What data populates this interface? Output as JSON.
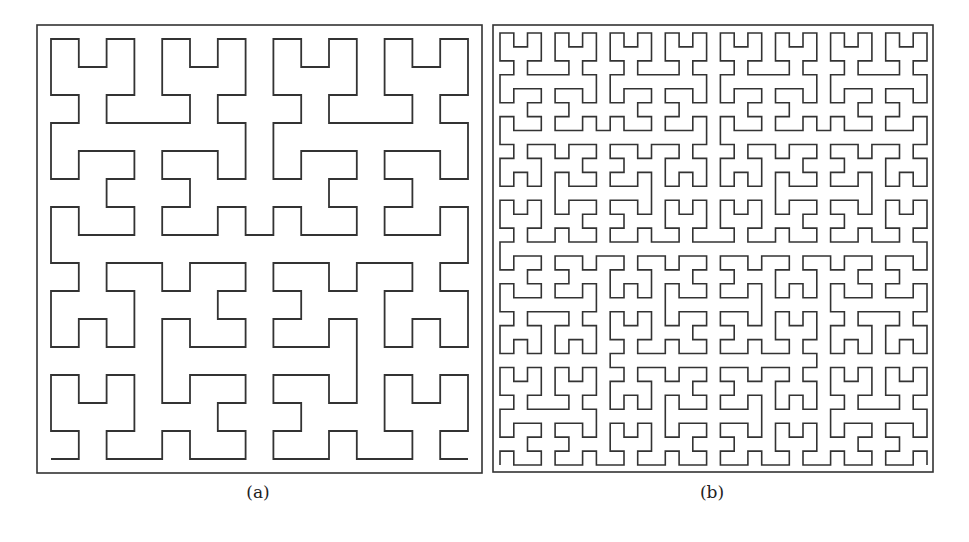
{
  "figure": {
    "colors": {
      "stroke": "#333333",
      "frame": "#333333",
      "background": "#ffffff"
    },
    "panels": [
      {
        "id": "a",
        "caption": "(a)",
        "curve": "Hilbert curve",
        "order": 4,
        "grid_size": 16,
        "first_step": "right",
        "frame": {
          "x": 37,
          "y": 25,
          "w": 445,
          "h": 448
        },
        "curve_box": {
          "x0": 51,
          "y0": 39,
          "x1": 468,
          "y1": 459
        },
        "caption_pos": {
          "x": 258,
          "y": 482
        }
      },
      {
        "id": "b",
        "caption": "(b)",
        "curve": "Hilbert curve",
        "order": 5,
        "grid_size": 32,
        "first_step": "up",
        "frame": {
          "x": 493,
          "y": 25,
          "w": 440,
          "h": 447
        },
        "curve_box": {
          "x0": 500,
          "y0": 33,
          "x1": 927,
          "y1": 465
        },
        "caption_pos": {
          "x": 712,
          "y": 482
        }
      }
    ]
  }
}
